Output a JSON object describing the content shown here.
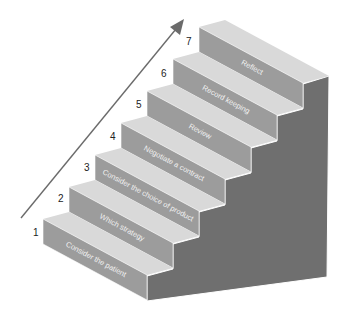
{
  "diagram": {
    "type": "staircase",
    "title": "",
    "arrow": {
      "direction": "up-right",
      "color": "#6b6b6b"
    },
    "steps": [
      {
        "number": "1",
        "label": "Consider the patient"
      },
      {
        "number": "2",
        "label": "Which strategy"
      },
      {
        "number": "3",
        "label": "Consider the choice of product"
      },
      {
        "number": "4",
        "label": "Negotiate a contract"
      },
      {
        "number": "5",
        "label": "Review"
      },
      {
        "number": "6",
        "label": "Record keeping"
      },
      {
        "number": "7",
        "label": "Reflect"
      }
    ],
    "colors": {
      "riser": "#9c9c9c",
      "tread": "#d9d9d9",
      "side": "#6f6f6f",
      "edge": "#ffffff",
      "label_text": "#f2f2f2",
      "number_text": "#222222"
    }
  }
}
